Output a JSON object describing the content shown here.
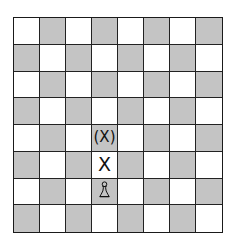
{
  "board": {
    "rows": 8,
    "cols": 8,
    "top_left": "light",
    "colors": {
      "light": "#ffffff",
      "dark": "#c4c4c4",
      "line": "#1a1a1a"
    },
    "marks": [
      {
        "row": 4,
        "col": 3,
        "label": "(X)",
        "type": "possible-move"
      },
      {
        "row": 5,
        "col": 3,
        "label": "X",
        "type": "move"
      }
    ],
    "pieces": [
      {
        "row": 6,
        "col": 3,
        "piece": "pawn",
        "color": "white",
        "icon": "pawn-icon"
      }
    ]
  }
}
